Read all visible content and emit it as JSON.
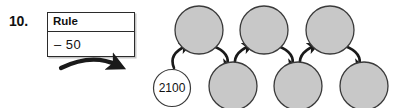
{
  "problem": {
    "number": "10.",
    "type": "whats-my-rule-chain"
  },
  "rule_box": {
    "header_label": "Rule",
    "rule_label": "– 50"
  },
  "chain": {
    "start_node": {
      "value": "2100",
      "filled": false,
      "row": "bottom"
    },
    "blank_nodes": [
      {
        "value": "",
        "filled": true,
        "row": "top"
      },
      {
        "value": "",
        "filled": true,
        "row": "bottom"
      },
      {
        "value": "",
        "filled": true,
        "row": "top"
      },
      {
        "value": "",
        "filled": true,
        "row": "bottom"
      },
      {
        "value": "",
        "filled": true,
        "row": "top"
      },
      {
        "value": "",
        "filled": true,
        "row": "bottom"
      }
    ],
    "arrow_count": 6
  },
  "colors": {
    "node_fill_blank": "#c8c8c8",
    "node_fill_start": "#ffffff",
    "node_stroke": "#3a3a3a",
    "arrow_stroke": "#1a1a1a",
    "box_stroke": "#2b2b2b",
    "text": "#111111",
    "background": "#ffffff"
  }
}
